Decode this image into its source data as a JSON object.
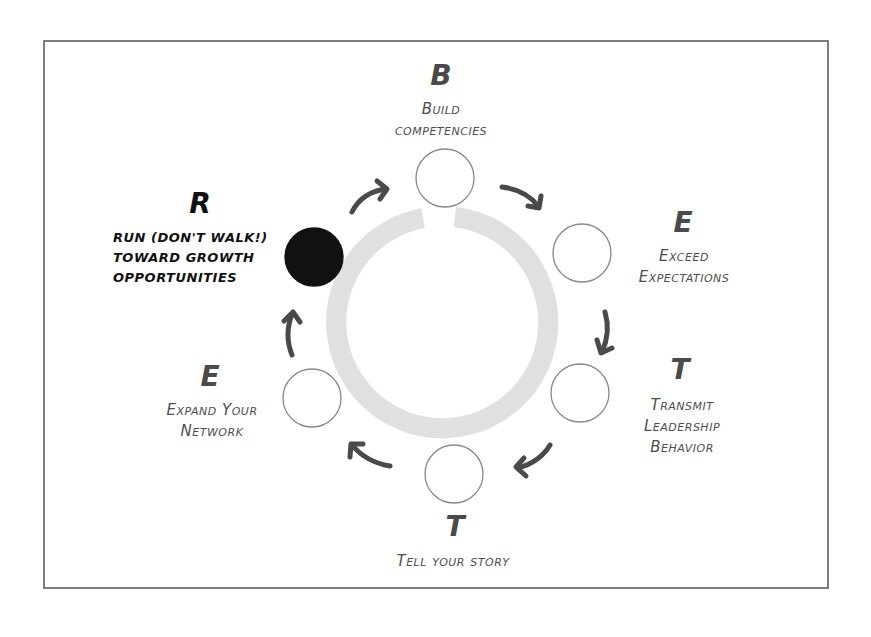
{
  "diagram": {
    "type": "cycle",
    "frame_color": "#7d7d7d",
    "ring_color": "#d8d8d8",
    "arrow_color": "#4a4a4a",
    "highlight_color": "#111111",
    "steps": [
      {
        "letter": "B",
        "lines": [
          "Build",
          "competencies"
        ],
        "active": false
      },
      {
        "letter": "E",
        "lines": [
          "Exceed",
          "Expectations"
        ],
        "active": false
      },
      {
        "letter": "T",
        "lines": [
          "Transmit",
          "Leadership",
          "Behavior"
        ],
        "active": false
      },
      {
        "letter": "T",
        "lines": [
          "Tell your story"
        ],
        "active": false
      },
      {
        "letter": "E",
        "lines": [
          "Expand Your",
          "Network"
        ],
        "active": false
      },
      {
        "letter": "R",
        "lines": [
          "Run (don't walk!)",
          "toward growth",
          "opportunities"
        ],
        "active": true
      }
    ]
  }
}
